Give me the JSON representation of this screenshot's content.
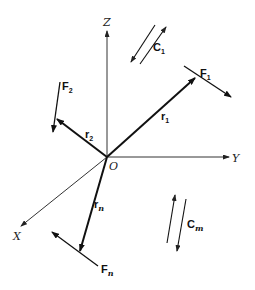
{
  "figure": {
    "origin_label": "O",
    "axes": {
      "x": {
        "label": "X"
      },
      "y": {
        "label": "Y"
      },
      "z": {
        "label": "Z"
      }
    },
    "position_vectors": [
      {
        "name": "r",
        "subscript": "1"
      },
      {
        "name": "r",
        "subscript": "2"
      },
      {
        "name": "r",
        "subscript": "n"
      }
    ],
    "forces": [
      {
        "name": "F",
        "subscript": "1"
      },
      {
        "name": "F",
        "subscript": "2"
      },
      {
        "name": "F",
        "subscript": "n"
      }
    ],
    "couples": [
      {
        "name": "C",
        "subscript": "1"
      },
      {
        "name": "C",
        "subscript": "m"
      }
    ],
    "colors": {
      "line": "#111111",
      "axis": "#333333",
      "background": "#ffffff"
    }
  }
}
